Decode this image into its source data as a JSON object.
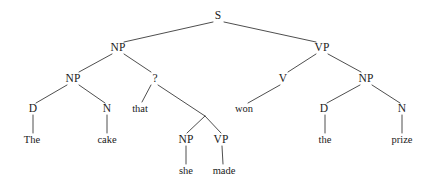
{
  "figure": {
    "kind": "syntax-tree",
    "sentence": "The cake that she made won the prize",
    "background_color": "#ffffff",
    "line_color": "#3a3a3a",
    "text_color": "#1a1a1a"
  },
  "nodes": [
    {
      "id": "s",
      "label": "S",
      "type": "category",
      "x": 218,
      "y": 16
    },
    {
      "id": "np1",
      "label": "NP",
      "type": "category",
      "x": 118,
      "y": 48
    },
    {
      "id": "vp1",
      "label": "VP",
      "type": "category",
      "x": 322,
      "y": 48
    },
    {
      "id": "np2",
      "label": "NP",
      "type": "category",
      "x": 73,
      "y": 79
    },
    {
      "id": "unknown",
      "label": "?",
      "type": "unknown",
      "x": 155,
      "y": 79
    },
    {
      "id": "v",
      "label": "V",
      "type": "category",
      "x": 283,
      "y": 79
    },
    {
      "id": "np3",
      "label": "NP",
      "type": "category",
      "x": 366,
      "y": 79
    },
    {
      "id": "d1",
      "label": "D",
      "type": "category",
      "x": 33,
      "y": 109
    },
    {
      "id": "n1",
      "label": "N",
      "type": "category",
      "x": 107,
      "y": 109
    },
    {
      "id": "that",
      "label": "that",
      "type": "word",
      "x": 140,
      "y": 109
    },
    {
      "id": "won",
      "label": "won",
      "type": "word",
      "x": 244,
      "y": 109
    },
    {
      "id": "d2",
      "label": "D",
      "type": "category",
      "x": 324,
      "y": 109
    },
    {
      "id": "n2",
      "label": "N",
      "type": "category",
      "x": 402,
      "y": 109
    },
    {
      "id": "the1",
      "label": "The",
      "type": "word",
      "x": 32,
      "y": 140
    },
    {
      "id": "cake",
      "label": "cake",
      "type": "word",
      "x": 107,
      "y": 140
    },
    {
      "id": "np4",
      "label": "NP",
      "type": "category",
      "x": 186,
      "y": 140
    },
    {
      "id": "vp2",
      "label": "VP",
      "type": "category",
      "x": 221,
      "y": 140
    },
    {
      "id": "the2",
      "label": "the",
      "type": "word",
      "x": 325,
      "y": 140
    },
    {
      "id": "prize",
      "label": "prize",
      "type": "word",
      "x": 402,
      "y": 140
    },
    {
      "id": "she",
      "label": "she",
      "type": "word",
      "x": 186,
      "y": 171
    },
    {
      "id": "made",
      "label": "made",
      "type": "word",
      "x": 224,
      "y": 171
    }
  ],
  "junctions": [
    {
      "id": "clausejoin",
      "x": 205,
      "y": 116
    }
  ],
  "edges": [
    {
      "from": "s",
      "to": "np1",
      "x1": 213,
      "y1": 22,
      "x2": 124,
      "y2": 42
    },
    {
      "from": "s",
      "to": "vp1",
      "x1": 224,
      "y1": 22,
      "x2": 316,
      "y2": 42
    },
    {
      "from": "np1",
      "to": "np2",
      "x1": 112,
      "y1": 54,
      "x2": 79,
      "y2": 72
    },
    {
      "from": "np1",
      "to": "unknown",
      "x1": 124,
      "y1": 54,
      "x2": 151,
      "y2": 72
    },
    {
      "from": "vp1",
      "to": "v",
      "x1": 316,
      "y1": 54,
      "x2": 288,
      "y2": 72
    },
    {
      "from": "vp1",
      "to": "np3",
      "x1": 328,
      "y1": 54,
      "x2": 361,
      "y2": 72
    },
    {
      "from": "np2",
      "to": "d1",
      "x1": 67,
      "y1": 85,
      "x2": 36,
      "y2": 103
    },
    {
      "from": "np2",
      "to": "n1",
      "x1": 79,
      "y1": 85,
      "x2": 105,
      "y2": 103
    },
    {
      "from": "unknown",
      "to": "that",
      "x1": 151,
      "y1": 85,
      "x2": 142,
      "y2": 102
    },
    {
      "from": "unknown",
      "to": "clausejoin",
      "x1": 158,
      "y1": 85,
      "x2": 205,
      "y2": 116
    },
    {
      "from": "clausejoin",
      "to": "np4",
      "x1": 205,
      "y1": 116,
      "x2": 187,
      "y2": 133
    },
    {
      "from": "clausejoin",
      "to": "vp2",
      "x1": 205,
      "y1": 116,
      "x2": 221,
      "y2": 133
    },
    {
      "from": "v",
      "to": "won",
      "x1": 280,
      "y1": 85,
      "x2": 248,
      "y2": 103
    },
    {
      "from": "np3",
      "to": "d2",
      "x1": 360,
      "y1": 85,
      "x2": 327,
      "y2": 103
    },
    {
      "from": "np3",
      "to": "n2",
      "x1": 372,
      "y1": 85,
      "x2": 400,
      "y2": 103
    },
    {
      "from": "d1",
      "to": "the1",
      "x1": 33,
      "y1": 115,
      "x2": 33,
      "y2": 133
    },
    {
      "from": "n1",
      "to": "cake",
      "x1": 107,
      "y1": 115,
      "x2": 107,
      "y2": 133
    },
    {
      "from": "d2",
      "to": "the2",
      "x1": 325,
      "y1": 115,
      "x2": 325,
      "y2": 133
    },
    {
      "from": "n2",
      "to": "prize",
      "x1": 402,
      "y1": 115,
      "x2": 402,
      "y2": 133
    },
    {
      "from": "np4",
      "to": "she",
      "x1": 186,
      "y1": 146,
      "x2": 186,
      "y2": 164
    },
    {
      "from": "vp2",
      "to": "made",
      "x1": 222,
      "y1": 146,
      "x2": 223,
      "y2": 164
    }
  ]
}
